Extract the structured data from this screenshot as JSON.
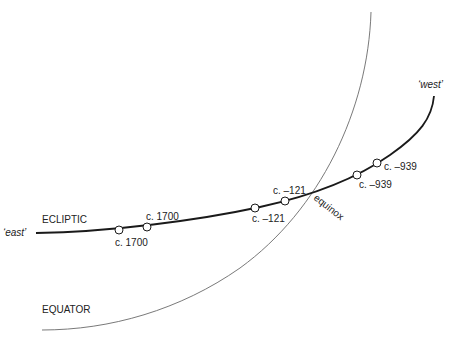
{
  "diagram": {
    "curves": [
      {
        "id": "ecliptic",
        "label": "ECLIPTIC",
        "stroke": "#1a1a1a",
        "width": 1.8
      },
      {
        "id": "equator",
        "label": "EQUATOR",
        "stroke": "#6a6a6a",
        "width": 0.9
      }
    ],
    "direction_labels": {
      "east": "‘east’",
      "west": "‘west’"
    },
    "intersection_label": "equinox",
    "markers": [
      {
        "label": "c. 1700",
        "position": "below"
      },
      {
        "label": "c. 1700",
        "position": "above"
      },
      {
        "label": "c. –121",
        "position": "below"
      },
      {
        "label": "c. –121",
        "position": "above"
      },
      {
        "label": "c. –939",
        "position": "right"
      },
      {
        "label": "c. –939",
        "position": "right"
      }
    ]
  }
}
